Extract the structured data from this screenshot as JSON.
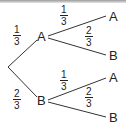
{
  "diagram": {
    "type": "probability-tree",
    "first_level": [
      {
        "outcome": "A",
        "probability": {
          "num": "1",
          "den": "3"
        }
      },
      {
        "outcome": "B",
        "probability": {
          "num": "2",
          "den": "3"
        }
      }
    ],
    "second_level": {
      "from_A": [
        {
          "outcome": "A",
          "probability": {
            "num": "1",
            "den": "3"
          }
        },
        {
          "outcome": "B",
          "probability": {
            "num": "2",
            "den": "3"
          }
        }
      ],
      "from_B": [
        {
          "outcome": "A",
          "probability": {
            "num": "1",
            "den": "3"
          }
        },
        {
          "outcome": "B",
          "probability": {
            "num": "2",
            "den": "3"
          }
        }
      ]
    }
  }
}
